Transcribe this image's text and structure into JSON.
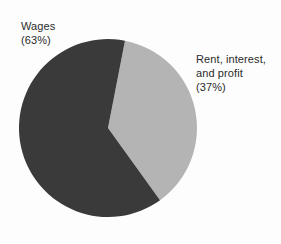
{
  "chart_data": {
    "type": "pie",
    "title": "",
    "subtitle": "",
    "xlabel": "",
    "ylabel": "",
    "grid": false,
    "legend_position": "none",
    "categories": [
      "Wages",
      "Rent, interest, and profit"
    ],
    "values": [
      63,
      37
    ],
    "units": "percent",
    "slices": [
      {
        "name": "Wages",
        "value": 63,
        "value_label": "(63%)",
        "color": "#3a3a3a",
        "label_lines": [
          "Wages",
          "(63%)"
        ],
        "start_angle_deg": 11,
        "end_angle_deg": 237.8
      },
      {
        "name": "Rent, interest, and profit",
        "value": 37,
        "value_label": "(37%)",
        "color": "#b4b4b4",
        "label_lines": [
          "Rent, interest,",
          "and profit",
          "(37%)"
        ],
        "start_angle_deg": 237.8,
        "end_angle_deg": 371
      }
    ],
    "annotations": []
  },
  "labels": {
    "wages": {
      "line1": "Wages",
      "line2": "(63%)"
    },
    "rent": {
      "line1": "Rent, interest,",
      "line2": "and profit",
      "line3": "(37%)"
    }
  },
  "colors": {
    "background": "#fdfdfd",
    "text": "#2b2b2b",
    "slice_dark": "#3a3a3a",
    "slice_light": "#b4b4b4"
  },
  "geometry": {
    "center_x": 108,
    "center_y": 128,
    "radius": 89
  }
}
